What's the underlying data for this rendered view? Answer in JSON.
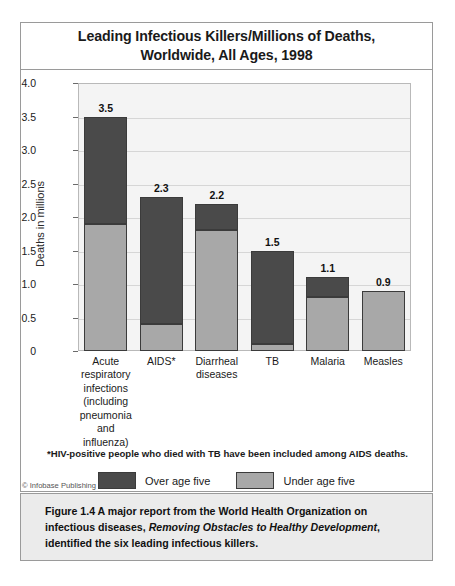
{
  "chart_data": {
    "type": "bar",
    "subtype": "stacked-vertical",
    "title": "Leading Infectious Killers/Millions of Deaths, Worldwide, All Ages, 1998",
    "title_line1": "Leading Infectious Killers/Millions of Deaths,",
    "title_line2": "Worldwide, All Ages, 1998",
    "xlabel": "",
    "ylabel": "Deaths in millions",
    "ylim": [
      0,
      4.0
    ],
    "ytick_labels": [
      "4.0",
      "3.5",
      "3.0",
      "2.5",
      "2.0",
      "1.5",
      "1.0",
      "0.5",
      "0"
    ],
    "ytick_values": [
      4.0,
      3.5,
      3.0,
      2.5,
      2.0,
      1.5,
      1.0,
      0.5,
      0
    ],
    "grid": "horizontal",
    "legend_position": "bottom-center",
    "categories": [
      "Acute respiratory infections (including pneumonia and influenza)",
      "AIDS*",
      "Diarrheal diseases",
      "TB",
      "Malaria",
      "Measles"
    ],
    "category_lines": [
      [
        "Acute",
        "respiratory",
        "infections",
        "(including",
        "pneumonia",
        "and influenza)"
      ],
      [
        "AIDS*"
      ],
      [
        "Diarrheal",
        "diseases"
      ],
      [
        "TB"
      ],
      [
        "Malaria"
      ],
      [
        "Measles"
      ]
    ],
    "totals": [
      3.5,
      2.3,
      2.2,
      1.5,
      1.1,
      0.9
    ],
    "total_labels": [
      "3.5",
      "2.3",
      "2.2",
      "1.5",
      "1.1",
      "0.9"
    ],
    "series": [
      {
        "name": "Under age five",
        "color": "#a8a8a8",
        "values": [
          1.9,
          0.4,
          1.8,
          0.1,
          0.8,
          0.9
        ]
      },
      {
        "name": "Over age five",
        "color": "#4a4a4a",
        "values": [
          1.6,
          1.9,
          0.4,
          1.4,
          0.3,
          0.0
        ]
      }
    ],
    "legend": [
      {
        "label": "Over age five",
        "color": "#4a4a4a"
      },
      {
        "label": "Under age five",
        "color": "#a8a8a8"
      }
    ],
    "footnote": "*HIV-positive people who died with TB have been included among AIDS deaths."
  },
  "credit": "© Infobase Publishing",
  "caption": {
    "figure_number": "Figure 1.4",
    "text_before": " A major report from the World Health Organization on infectious diseases, ",
    "book_title": "Removing Obstacles to Healthy Development",
    "text_after": ", identified the six leading infectious killers."
  },
  "colors": {
    "over_five": "#4a4a4a",
    "under_five": "#a8a8a8",
    "plot_background": "#f4f4f4",
    "gridline": "#d6d6d6",
    "frame_border": "#9a9a9a",
    "caption_background": "#ebebeb"
  }
}
